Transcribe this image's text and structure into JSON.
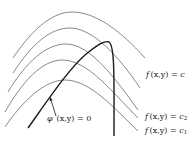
{
  "diagram": {
    "level_curves": [
      {
        "id": "curve-1",
        "path": "M13,58 C35,25 55,12 72,12 C95,12 120,30 145,58"
      },
      {
        "id": "curve-2",
        "path": "M13,73 C32,44 50,28 70,28 C92,28 118,55 140,88"
      },
      {
        "id": "curve-3",
        "path": "M8,92 C26,62 46,44 66,44 C90,44 115,78 138,110"
      },
      {
        "id": "curve-4",
        "path": "M5,112 C22,82 42,60 62,60 C88,60 112,92 138,118"
      },
      {
        "id": "curve-5",
        "path": "M5,127 C22,102 44,80 65,80 C90,80 114,108 138,131"
      }
    ],
    "constraint_curve": {
      "path": "M28,128 C48,100 68,70 85,55 C96,46 104,40 109,42 C115,46 114,80 114,136"
    },
    "arrow": {
      "x1": 56,
      "y1": 116,
      "x2": 50,
      "y2": 97
    },
    "labels": {
      "f_c": {
        "f": "f",
        "args": "(x,y) = ",
        "c": "c",
        "sub": ""
      },
      "f_c2": {
        "f": "f",
        "args": "(x,y) = ",
        "c": "c",
        "sub": "2"
      },
      "f_c1": {
        "f": "f",
        "args": "(x,y) = ",
        "c": "c",
        "sub": "1"
      },
      "phi": {
        "phi": "φ",
        "args": "(x,y) = 0"
      }
    },
    "colors": {
      "level_curve": "#7a7a7a",
      "constraint_curve": "#1a1a1a",
      "text": "#222222"
    }
  }
}
